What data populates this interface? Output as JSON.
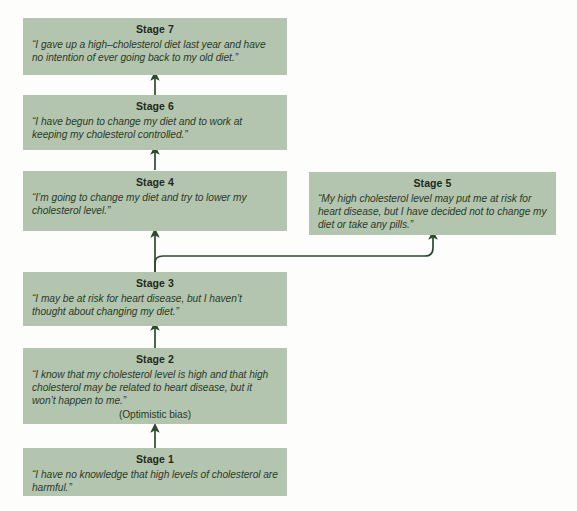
{
  "diagram": {
    "box_color": "#b3c5ae",
    "arrow_color": "#2d4a2d",
    "background_color": "#fdfdfc",
    "stages": [
      {
        "id": "stage-7",
        "title": "Stage 7",
        "quote": "“I gave up a high–cholesterol diet last year and have no intention of ever going back to my old diet.”",
        "note": ""
      },
      {
        "id": "stage-6",
        "title": "Stage 6",
        "quote": "“I have begun to change my diet and to work at keeping my cholesterol controlled.”",
        "note": ""
      },
      {
        "id": "stage-4",
        "title": "Stage 4",
        "quote": "“I’m going to change my diet and try to lower my cholesterol level.”",
        "note": ""
      },
      {
        "id": "stage-5",
        "title": "Stage 5",
        "quote": "“My high cholesterol level may put me at risk for heart disease, but I have decided not to change my diet or take any pills.”",
        "note": ""
      },
      {
        "id": "stage-3",
        "title": "Stage 3",
        "quote": "“I may be at risk for heart disease, but I haven’t thought about changing my diet.”",
        "note": ""
      },
      {
        "id": "stage-2",
        "title": "Stage 2",
        "quote": "“I know that my cholesterol level is high and that high cholesterol may be related to heart disease, but it won’t happen to me.”",
        "note": "(Optimistic bias)"
      },
      {
        "id": "stage-1",
        "title": "Stage 1",
        "quote": "“I have no knowledge that high levels of cholesterol are harmful.”",
        "note": ""
      }
    ],
    "connectors": [
      {
        "id": "arrow-stage6-to-stage7",
        "from": "Stage 6",
        "to": "Stage 7"
      },
      {
        "id": "arrow-stage4-to-stage6",
        "from": "Stage 4",
        "to": "Stage 6"
      },
      {
        "id": "arrow-stage3-to-stage4",
        "from": "Stage 3",
        "to": "Stage 4"
      },
      {
        "id": "arrow-stage3-to-stage5",
        "from": "Stage 3",
        "to": "Stage 5"
      },
      {
        "id": "arrow-stage2-to-stage3",
        "from": "Stage 2",
        "to": "Stage 3"
      },
      {
        "id": "arrow-stage1-to-stage2",
        "from": "Stage 1",
        "to": "Stage 2"
      }
    ]
  }
}
